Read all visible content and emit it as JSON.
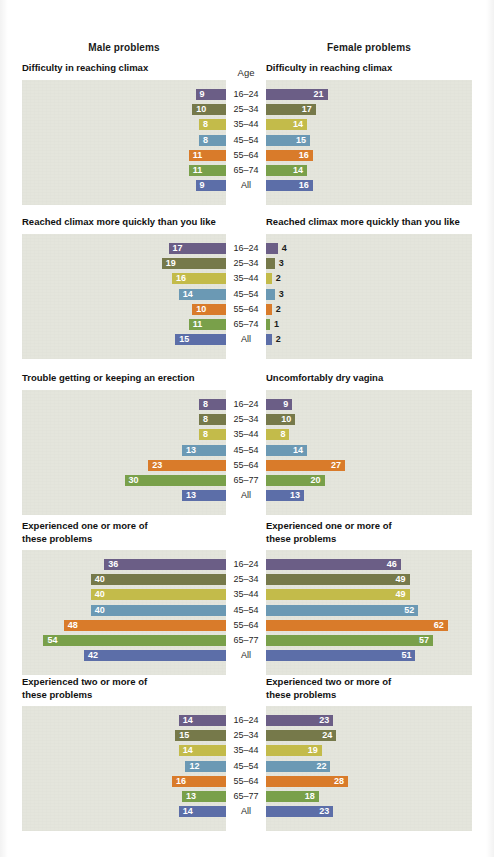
{
  "header": {
    "male_label": "Male problems",
    "female_label": "Female problems",
    "age_label": "Age"
  },
  "palette": {
    "16-24": "#6b5e86",
    "25-34": "#76794a",
    "35-44": "#c3bb4a",
    "45-54": "#6b99b4",
    "55-64": "#d97b2a",
    "65-74": "#79a04a",
    "65-77": "#79a04a",
    "All": "#5c6ea8",
    "panel_bg": "#e4e5dc",
    "page_bg": "#ffffff",
    "text": "#111111"
  },
  "chart_data": {
    "type": "bar",
    "xlabel": "Percent reporting problem (%)",
    "ylabel": "Age",
    "orientation": "horizontal-diverging",
    "grid": false,
    "legend": "none",
    "categories": [
      "16–24",
      "25–34",
      "35–44",
      "45–54",
      "55–64",
      "65–74",
      "All"
    ],
    "xlim": [
      0,
      62
    ],
    "panels": [
      {
        "id": "difficulty-reaching-climax",
        "left_title": "Difficulty in reaching climax",
        "right_title": "Difficulty in reaching climax",
        "age_header": "Age",
        "categories": [
          "16–24",
          "25–34",
          "35–44",
          "45–54",
          "55–64",
          "65–74",
          "All"
        ],
        "series": [
          {
            "name": "Male problems",
            "values": [
              9,
              10,
              8,
              8,
              11,
              11,
              9
            ]
          },
          {
            "name": "Female problems",
            "values": [
              21,
              17,
              14,
              15,
              16,
              14,
              16
            ]
          }
        ]
      },
      {
        "id": "reached-climax-more-quickly",
        "left_title": "Reached climax more quickly than you like",
        "right_title": "Reached climax more quickly than you like",
        "age_header": "",
        "categories": [
          "16–24",
          "25–34",
          "35–44",
          "45–54",
          "55–64",
          "65–74",
          "All"
        ],
        "series": [
          {
            "name": "Male problems",
            "values": [
              17,
              19,
              16,
              14,
              10,
              11,
              15
            ]
          },
          {
            "name": "Female problems",
            "values": [
              4,
              3,
              2,
              3,
              2,
              1,
              2
            ]
          }
        ]
      },
      {
        "id": "erection-dryness",
        "left_title": "Trouble getting or keeping an erection",
        "right_title": "Uncomfortably dry vagina",
        "age_header": "",
        "categories": [
          "16–24",
          "25–34",
          "35–44",
          "45–54",
          "55–64",
          "65–77",
          "All"
        ],
        "series": [
          {
            "name": "Male problems",
            "values": [
              8,
              8,
              8,
              13,
              23,
              30,
              13
            ]
          },
          {
            "name": "Female problems",
            "values": [
              9,
              10,
              8,
              14,
              27,
              20,
              13
            ]
          }
        ]
      },
      {
        "id": "one-or-more-problems",
        "left_title": "Experienced one or more of\nthese problems",
        "right_title": "Experienced one or more of\nthese problems",
        "age_header": "",
        "categories": [
          "16–24",
          "25–34",
          "35–44",
          "45–54",
          "55–64",
          "65–77",
          "All"
        ],
        "series": [
          {
            "name": "Male problems",
            "values": [
              36,
              40,
              40,
              40,
              48,
              54,
              42
            ]
          },
          {
            "name": "Female problems",
            "values": [
              46,
              49,
              49,
              52,
              62,
              57,
              51
            ]
          }
        ]
      },
      {
        "id": "two-or-more-problems",
        "left_title": "Experienced two or more of\nthese problems",
        "right_title": "Experienced two or more of\nthese problems",
        "age_header": "",
        "categories": [
          "16–24",
          "25–34",
          "35–44",
          "45–54",
          "55–64",
          "65–77",
          "All"
        ],
        "series": [
          {
            "name": "Male problems",
            "values": [
              14,
              15,
              14,
              12,
              16,
              13,
              14
            ]
          },
          {
            "name": "Female problems",
            "values": [
              23,
              24,
              19,
              22,
              28,
              18,
              23
            ]
          }
        ]
      }
    ]
  }
}
